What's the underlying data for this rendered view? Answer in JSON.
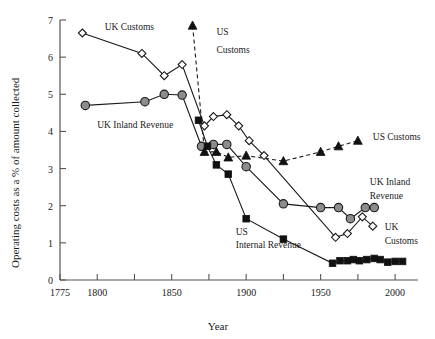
{
  "chart_data": {
    "type": "line",
    "title": "",
    "xlabel": "Year",
    "ylabel": "Operating costs as a % of amount collected",
    "xlim": [
      1775,
      2010
    ],
    "ylim": [
      0,
      7
    ],
    "xticks": [
      1775,
      1800,
      1825,
      1850,
      1875,
      1900,
      1925,
      1950,
      1975,
      2000
    ],
    "xticklabels": [
      "1775",
      "1800",
      "",
      "1850",
      "",
      "1900",
      "",
      "1950",
      "",
      "2000"
    ],
    "yticks": [
      0,
      1,
      2,
      3,
      4,
      5,
      6,
      7
    ],
    "yticklabels": [
      "0",
      "1",
      "2",
      "3",
      "4",
      "5",
      "6",
      "7"
    ],
    "grid": false,
    "legend": "inline annotations",
    "series": [
      {
        "name": "UK Customs",
        "marker": "open-diamond",
        "linestyle": "solid",
        "color": "#ffffff",
        "points": [
          {
            "x": 1790,
            "y": 6.65
          },
          {
            "x": 1830,
            "y": 6.1
          },
          {
            "x": 1845,
            "y": 5.5
          },
          {
            "x": 1857,
            "y": 5.8
          },
          {
            "x": 1872,
            "y": 4.15
          },
          {
            "x": 1878,
            "y": 4.4
          },
          {
            "x": 1887,
            "y": 4.45
          },
          {
            "x": 1895,
            "y": 4.15
          },
          {
            "x": 1902,
            "y": 3.75
          },
          {
            "x": 1912,
            "y": 3.35
          },
          {
            "x": 1960,
            "y": 1.15
          },
          {
            "x": 1968,
            "y": 1.25
          },
          {
            "x": 1978,
            "y": 1.7
          },
          {
            "x": 1985,
            "y": 1.45
          }
        ]
      },
      {
        "name": "UK Inland Revenue",
        "marker": "filled-grey-circle",
        "linestyle": "solid",
        "color": "#8c8c8c",
        "points": [
          {
            "x": 1792,
            "y": 4.7
          },
          {
            "x": 1832,
            "y": 4.8
          },
          {
            "x": 1845,
            "y": 5.0
          },
          {
            "x": 1857,
            "y": 4.98
          },
          {
            "x": 1870,
            "y": 3.6
          },
          {
            "x": 1878,
            "y": 3.65
          },
          {
            "x": 1887,
            "y": 3.65
          },
          {
            "x": 1900,
            "y": 3.05
          },
          {
            "x": 1925,
            "y": 2.05
          },
          {
            "x": 1950,
            "y": 1.95
          },
          {
            "x": 1962,
            "y": 1.95
          },
          {
            "x": 1970,
            "y": 1.65
          },
          {
            "x": 1980,
            "y": 1.95
          },
          {
            "x": 1986,
            "y": 1.95
          }
        ]
      },
      {
        "name": "US Customs",
        "marker": "filled-black-triangle",
        "linestyle": "dashed",
        "color": "#111111",
        "points": [
          {
            "x": 1864,
            "y": 6.85
          },
          {
            "x": 1872,
            "y": 3.45
          },
          {
            "x": 1880,
            "y": 3.45
          },
          {
            "x": 1888,
            "y": 3.3
          },
          {
            "x": 1900,
            "y": 3.35
          },
          {
            "x": 1925,
            "y": 3.2
          },
          {
            "x": 1950,
            "y": 3.45
          },
          {
            "x": 1962,
            "y": 3.6
          },
          {
            "x": 1975,
            "y": 3.75
          }
        ]
      },
      {
        "name": "US Internal Revenue",
        "marker": "filled-black-square",
        "linestyle": "solid",
        "color": "#111111",
        "points": [
          {
            "x": 1868,
            "y": 4.3
          },
          {
            "x": 1874,
            "y": 3.6
          },
          {
            "x": 1880,
            "y": 3.1
          },
          {
            "x": 1888,
            "y": 2.85
          },
          {
            "x": 1900,
            "y": 1.65
          },
          {
            "x": 1925,
            "y": 1.1
          },
          {
            "x": 1958,
            "y": 0.45
          },
          {
            "x": 1963,
            "y": 0.52
          },
          {
            "x": 1968,
            "y": 0.52
          },
          {
            "x": 1972,
            "y": 0.55
          },
          {
            "x": 1976,
            "y": 0.52
          },
          {
            "x": 1981,
            "y": 0.55
          },
          {
            "x": 1986,
            "y": 0.58
          },
          {
            "x": 1990,
            "y": 0.55
          },
          {
            "x": 1995,
            "y": 0.48
          },
          {
            "x": 2000,
            "y": 0.5
          },
          {
            "x": 2005,
            "y": 0.5
          }
        ]
      }
    ],
    "annotations": [
      {
        "id": "ann-uk-customs-top",
        "text": "UK Customs",
        "x": 1805,
        "y": 6.72
      },
      {
        "id": "ann-uk-inland-revenue-left",
        "text": "UK Inland Revenue",
        "x": 1800,
        "y": 4.1
      },
      {
        "id": "ann-us-customs-top-1",
        "text": "US",
        "x": 1880,
        "y": 6.6
      },
      {
        "id": "ann-us-customs-top-2",
        "text": "Customs",
        "x": 1880,
        "y": 6.1
      },
      {
        "id": "ann-us-customs-right",
        "text": "US Customs",
        "x": 1985,
        "y": 3.78
      },
      {
        "id": "ann-uk-inland-revenue-right-1",
        "text": "UK Inland",
        "x": 1983,
        "y": 2.55
      },
      {
        "id": "ann-uk-inland-revenue-right-2",
        "text": "Revenue",
        "x": 1983,
        "y": 2.18
      },
      {
        "id": "ann-uk-customs-right-1",
        "text": "UK",
        "x": 1993,
        "y": 1.35
      },
      {
        "id": "ann-uk-customs-right-2",
        "text": "Customs",
        "x": 1993,
        "y": 0.98
      },
      {
        "id": "ann-us-internal-revenue-1",
        "text": "US",
        "x": 1893,
        "y": 1.22
      },
      {
        "id": "ann-us-internal-revenue-2",
        "text": "Internal Revenue",
        "x": 1893,
        "y": 0.85
      }
    ]
  },
  "colors": {
    "grey_marker": "#8c8c8c",
    "black_marker": "#111111",
    "axis": "#555555",
    "background": "#ffffff",
    "text": "#1a1a1a"
  }
}
